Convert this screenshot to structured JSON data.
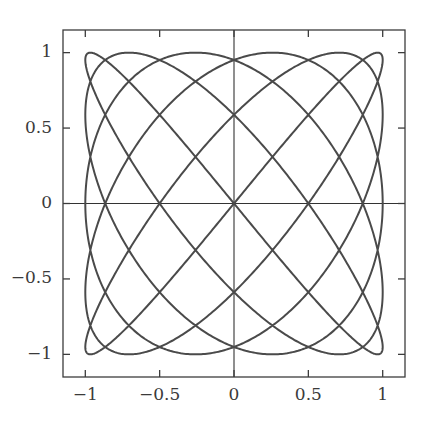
{
  "figure": {
    "background_color": "#ffffff",
    "curve_color": "#4a4a4a",
    "frame_color": "#3c3c3c",
    "axis_color": "#333333",
    "tick_color": "#3c3c3c",
    "label_color": "#3a3a3a"
  },
  "chart_data": {
    "type": "line",
    "title": "",
    "xlabel": "",
    "ylabel": "",
    "xlim": [
      -1.15,
      1.15
    ],
    "ylim": [
      -1.15,
      1.15
    ],
    "grid": false,
    "legend": null,
    "axis_lines": {
      "x_zero": 0,
      "y_zero": 0
    },
    "xticks": [
      -1,
      -0.5,
      0,
      0.5,
      1
    ],
    "xticklabels": [
      "-1",
      "-0.5",
      "0",
      "0.5",
      "1"
    ],
    "yticks": [
      -1,
      -0.5,
      0,
      0.5,
      1
    ],
    "yticklabels": [
      "-1",
      "-0.5",
      "0",
      "0.5",
      "1"
    ],
    "tick_direction": "in",
    "series": [
      {
        "name": "lissajous",
        "parametric": true,
        "x_expression": "cos(5*t)",
        "y_expression": "sin(6*t)",
        "a": 5,
        "b": 6,
        "phase": 0,
        "t_min": 0,
        "t_max": 6.283185307179586,
        "n_points": 2400,
        "amplitude_x": 1,
        "amplitude_y": 1,
        "line_width": 2.0,
        "color": "#4a4a4a"
      }
    ]
  }
}
